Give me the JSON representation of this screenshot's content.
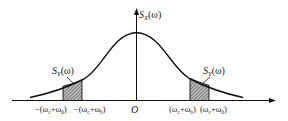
{
  "diagram": {
    "y_axis_label": "S",
    "y_axis_sub": "X",
    "y_axis_arg": "(ω)",
    "band_label_left": "S",
    "band_label_left_sub": "Y",
    "band_label_left_arg": "(ω)",
    "band_label_right": "S",
    "band_label_right_sub": "Y",
    "band_label_right_arg": "(ω)",
    "origin_label": "O",
    "tick_labels": [
      "−(ω_c+ω_0)",
      "−(ω_c+ω_b)",
      "(ω_c+ω_b)",
      "(ω_c+ω_0)"
    ],
    "tick_text": {
      "neg_outer": "−(ω",
      "neg_outer_sub1": "c",
      "neg_outer_mid": "+ω",
      "neg_outer_sub2": "0",
      "neg_outer_end": ")",
      "neg_inner": "−(ω",
      "neg_inner_sub1": "c",
      "neg_inner_mid": "+ω",
      "neg_inner_sub2": "b",
      "neg_inner_end": ")",
      "pos_inner": "(ω",
      "pos_inner_sub1": "c",
      "pos_inner_mid": "+ω",
      "pos_inner_sub2": "b",
      "pos_inner_end": ")",
      "pos_outer": "(ω",
      "pos_outer_sub1": "c",
      "pos_outer_mid": "+ω",
      "pos_outer_sub2": "0",
      "pos_outer_end": ")"
    },
    "colors": {
      "line": "#111111",
      "hatch": "#555555"
    }
  }
}
